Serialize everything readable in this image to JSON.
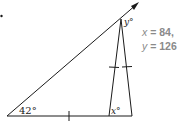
{
  "diagram": {
    "angles": {
      "left_vertex": "42°",
      "base_interior": "x°",
      "apex": "y°"
    },
    "answer": {
      "line1_var": "x",
      "line1_rest": " = 84,",
      "line2_var": "y",
      "line2_rest": " = 126"
    },
    "colors": {
      "lines": "#1a1a1a",
      "answer_text": "#8a8a8a"
    }
  }
}
